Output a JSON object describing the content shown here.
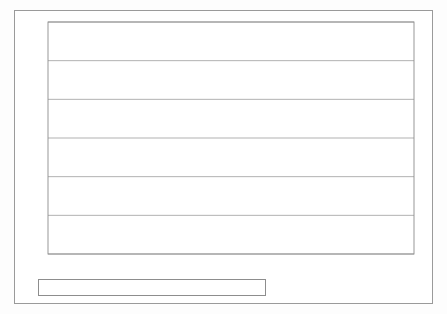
{
  "chart_data": {
    "type": "line",
    "title": "",
    "subtitle": "",
    "xlabel": "",
    "ylabel": "",
    "categories": [
      "1991",
      "1992",
      "1993",
      "1994",
      "1995",
      "1996",
      "1997",
      "1998",
      "1999",
      "2000",
      "2001",
      "2002",
      "2003",
      "2004"
    ],
    "ylim": [
      0,
      120
    ],
    "yticks": [
      0,
      20,
      40,
      60,
      80,
      100,
      120
    ],
    "ytick_labels": [
      "0",
      "20",
      "40",
      "60",
      "80",
      "100",
      "120"
    ],
    "grid": "horizontal",
    "legend_position": "bottom",
    "series": [
      {
        "name": "Below £10m",
        "style": "dotted",
        "color": "#9a9a9a",
        "marker": "diamond",
        "values": [
          39,
          31,
          34.5,
          35,
          34.5,
          32.5,
          27,
          27.5,
          23,
          15,
          15,
          10,
          5,
          1
        ]
      },
      {
        "name": "£10m-£100m",
        "style": "solid",
        "color": "#8a8a8a",
        "marker": "square",
        "values": [
          77,
          85,
          77,
          75,
          72,
          65,
          60,
          59,
          40,
          36,
          22,
          18,
          5,
          1
        ]
      },
      {
        "name": "Above £100m",
        "style": "dashed",
        "color": "#111111",
        "marker": "triangle",
        "values": [
          100,
          100,
          100,
          75,
          68,
          80,
          70,
          62,
          62,
          38,
          22,
          27,
          5,
          1
        ]
      }
    ]
  },
  "legend": {
    "items": [
      {
        "label": "Below £10m"
      },
      {
        "label": "£10m-£100m"
      },
      {
        "label": "Above £100m"
      }
    ]
  }
}
